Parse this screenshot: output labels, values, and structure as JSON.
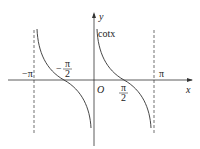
{
  "diagram": {
    "function_label": "cotx",
    "axes": {
      "x_label": "x",
      "y_label": "y",
      "origin_label": "O"
    },
    "ticks": {
      "neg_pi": "−π",
      "neg_half_pi_num": "π",
      "neg_half_pi_sign": "−",
      "half_pi_num": "π",
      "den": "2",
      "pi": "π"
    },
    "asymptotes": [
      "x = −π",
      "x = 0",
      "x = π"
    ],
    "colors": {
      "curve": "#333333",
      "axis": "#333333"
    }
  }
}
